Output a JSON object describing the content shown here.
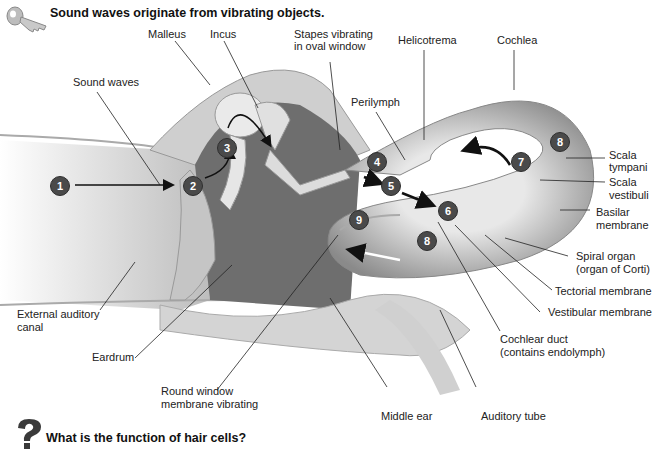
{
  "header": {
    "title": "Sound waves originate from vibrating objects.",
    "icon": "key-icon"
  },
  "footer": {
    "question": "What is the function of hair cells?",
    "icon": "question-mark-icon"
  },
  "labels": {
    "malleus": "Malleus",
    "incus": "Incus",
    "stapes_1": "Stapes vibrating",
    "stapes_2": "in oval window",
    "helicotrema": "Helicotrema",
    "cochlea": "Cochlea",
    "sound_waves": "Sound waves",
    "perilymph": "Perilymph",
    "scala_tympani_1": "Scala",
    "scala_tympani_2": "tympani",
    "scala_vestibuli_1": "Scala",
    "scala_vestibuli_2": "vestibuli",
    "basilar_1": "Basilar",
    "basilar_2": "membrane",
    "spiral_1": "Spiral organ",
    "spiral_2": "(organ of Corti)",
    "tectorial": "Tectorial membrane",
    "vestibular": "Vestibular membrane",
    "cochlear_duct_1": "Cochlear duct",
    "cochlear_duct_2": "(contains endolymph)",
    "external_canal_1": "External auditory",
    "external_canal_2": "canal",
    "eardrum": "Eardrum",
    "round_window_1": "Round window",
    "round_window_2": "membrane vibrating",
    "middle_ear": "Middle ear",
    "auditory_tube": "Auditory tube"
  },
  "steps": [
    "1",
    "2",
    "3",
    "4",
    "5",
    "6",
    "7",
    "8",
    "8",
    "9"
  ],
  "colors": {
    "badge": "#4a4a4a",
    "tissue_dark": "#6f6f6f",
    "tissue_light": "#d8d8d8",
    "bone": "#c8c8c8"
  }
}
